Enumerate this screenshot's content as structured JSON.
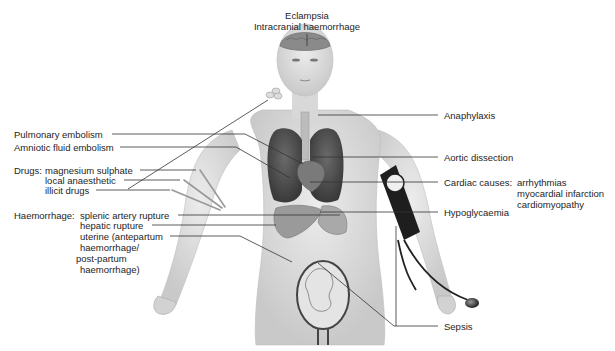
{
  "diagram": {
    "top_labels": [
      "Eclampsia",
      "Intracranial haemorrhage"
    ],
    "left_labels": {
      "pulmonary_embolism": "Pulmonary embolism",
      "amniotic_fluid_embolism": "Amniotic fluid embolism",
      "drugs": {
        "heading": "Drugs:",
        "items": [
          "magnesium sulphate",
          "local anaesthetic",
          "illicit drugs"
        ]
      },
      "haemorrhage": {
        "heading": "Haemorrhage:",
        "items": [
          "splenic artery rupture",
          "hepatic rupture",
          "uterine (antepartum",
          "haemorrhage/",
          "post-partum",
          "haemorrhage)"
        ]
      }
    },
    "right_labels": {
      "anaphylaxis": "Anaphylaxis",
      "aortic_dissection": "Aortic dissection",
      "cardiac": {
        "heading": "Cardiac causes:",
        "items": [
          "arrhythmias",
          "myocardial infarction",
          "cardiomyopathy"
        ]
      },
      "hypoglycaemia": "Hypoglycaemia",
      "sepsis": "Sepsis"
    }
  }
}
